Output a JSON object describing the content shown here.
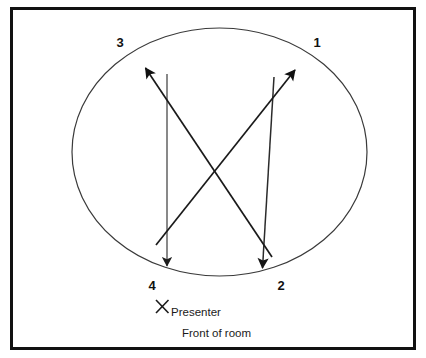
{
  "diagram": {
    "frame": {
      "border_color": "#111111",
      "background_color": "#ffffff"
    },
    "room_shape": {
      "name": "oval-room-outline",
      "type": "ellipse",
      "stroke_color": "#3a3a3a"
    },
    "positions": [
      {
        "id": "1",
        "label": "1",
        "corner": "top-right"
      },
      {
        "id": "2",
        "label": "2",
        "corner": "bottom-right"
      },
      {
        "id": "3",
        "label": "3",
        "corner": "top-left"
      },
      {
        "id": "4",
        "label": "4",
        "corner": "bottom-left"
      }
    ],
    "arrows": [
      {
        "name": "arrow-straight-left-down",
        "from": "3",
        "to": "4",
        "direction": "down",
        "style": "straight-vertical",
        "color": "#4a4a4a"
      },
      {
        "name": "arrow-straight-right-down",
        "from": "1",
        "to": "2",
        "direction": "down",
        "style": "straight-vertical",
        "color": "#2b2b2b"
      },
      {
        "name": "arrow-diagonal-up-left",
        "from": "2",
        "to": "3",
        "direction": "up-left",
        "style": "diagonal",
        "color": "#1a1a1a"
      },
      {
        "name": "arrow-diagonal-up-right",
        "from": "4",
        "to": "1",
        "direction": "up-right",
        "style": "diagonal",
        "color": "#1a1a1a"
      }
    ],
    "presenter": {
      "marker": "x-mark",
      "label": "Presenter"
    },
    "front_of_room": {
      "label": "Front of room"
    }
  }
}
